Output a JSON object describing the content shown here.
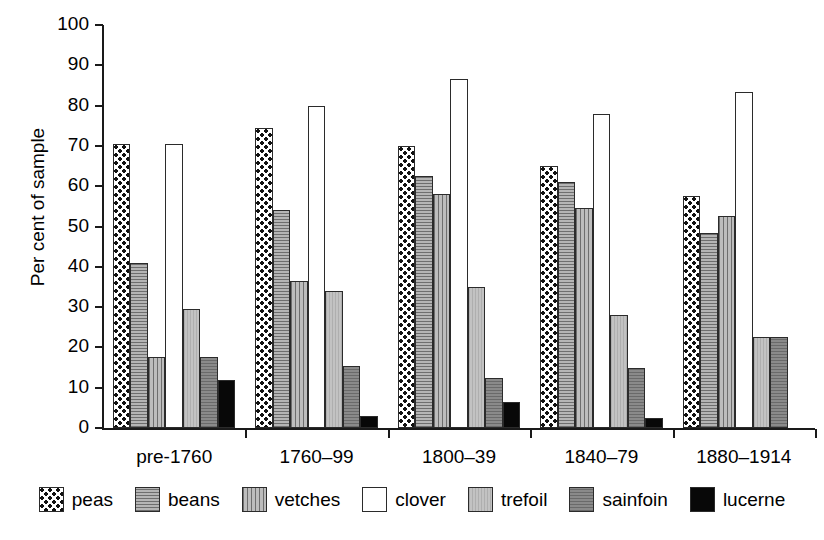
{
  "chart_data": {
    "type": "bar",
    "title": "",
    "xlabel": "",
    "ylabel": "Per cent of sample",
    "ylim": [
      0,
      100
    ],
    "ytick_labels": [
      "0",
      "10",
      "20",
      "30",
      "40",
      "50",
      "60",
      "70",
      "80",
      "90",
      "100"
    ],
    "yticks": [
      0,
      10,
      20,
      30,
      40,
      50,
      60,
      70,
      80,
      90,
      100
    ],
    "grid": false,
    "legend_position": "bottom",
    "categories": [
      "pre-1760",
      "1760–99",
      "1800–39",
      "1840–79",
      "1880–1914"
    ],
    "series": [
      {
        "name": "peas",
        "pattern": "checkerboard-dots",
        "values": [
          70.5,
          74.5,
          70.0,
          65.0,
          57.5
        ]
      },
      {
        "name": "beans",
        "pattern": "horizontal-hatch",
        "values": [
          41.0,
          54.0,
          62.5,
          61.0,
          48.5
        ]
      },
      {
        "name": "vetches",
        "pattern": "vertical-hatch",
        "values": [
          17.5,
          36.5,
          58.0,
          54.5,
          52.5
        ]
      },
      {
        "name": "clover",
        "pattern": "solid-white",
        "values": [
          70.5,
          80.0,
          86.5,
          78.0,
          83.5
        ]
      },
      {
        "name": "trefoil",
        "pattern": "light-grey",
        "values": [
          29.5,
          34.0,
          35.0,
          28.0,
          22.5
        ]
      },
      {
        "name": "sainfoin",
        "pattern": "dark-grey-hatch",
        "values": [
          17.5,
          15.5,
          12.5,
          15.0,
          22.5
        ]
      },
      {
        "name": "lucerne",
        "pattern": "solid-black",
        "values": [
          12.0,
          3.0,
          6.5,
          2.5,
          0.0
        ]
      }
    ]
  },
  "legend": {
    "items": [
      {
        "label": "peas"
      },
      {
        "label": "beans"
      },
      {
        "label": "vetches"
      },
      {
        "label": "clover"
      },
      {
        "label": "trefoil"
      },
      {
        "label": "sainfoin"
      },
      {
        "label": "lucerne"
      }
    ]
  },
  "colors": {
    "axis": "#1a1a1a",
    "background": "#ffffff",
    "peas": "#ffffff",
    "beans": "#a3a3a3",
    "vetches": "#a8a8a8",
    "clover": "#ffffff",
    "trefoil": "#b9b9b9",
    "sainfoin": "#7e7e7e",
    "lucerne": "#080808"
  }
}
